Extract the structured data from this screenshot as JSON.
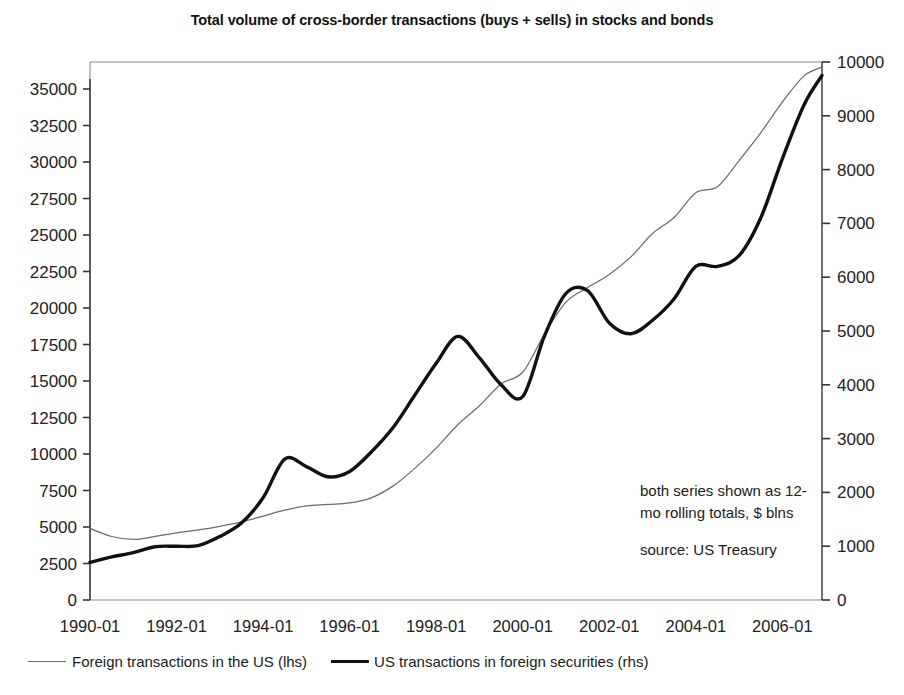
{
  "chart_data": {
    "type": "line",
    "title": "Total volume of cross-border transactions (buys + sells) in stocks and bonds",
    "xlabel": "",
    "ylabel": "",
    "grid": false,
    "legend_position": "bottom-left",
    "annotations": [
      "both series shown as 12-mo rolling totals, $ blns",
      "source: US Treasury"
    ],
    "x_tick_labels": [
      "1990-01",
      "1992-01",
      "1994-01",
      "1996-01",
      "1998-01",
      "2000-01",
      "2002-01",
      "2004-01",
      "2006-01"
    ],
    "x_range": [
      "1990-01",
      "2006-12"
    ],
    "axes": {
      "left": {
        "label": "Foreign transactions in the US (lhs)",
        "ylim": [
          0,
          35000
        ],
        "ticks": [
          0,
          2500,
          5000,
          7500,
          10000,
          12500,
          15000,
          17500,
          20000,
          22500,
          25000,
          27500,
          30000,
          32500,
          35000
        ],
        "tick_labels": [
          "0",
          "2500",
          "5000",
          "7500",
          "10000",
          "12500",
          "15000",
          "17500",
          "20000",
          "22500",
          "25000",
          "27500",
          "30000",
          "32500",
          "35000"
        ]
      },
      "right": {
        "label": "US transactions in foreign securities (rhs)",
        "ylim": [
          0,
          10000
        ],
        "ticks": [
          0,
          1000,
          2000,
          3000,
          4000,
          5000,
          6000,
          7000,
          8000,
          9000,
          10000
        ],
        "tick_labels": [
          "0",
          "1000",
          "2000",
          "3000",
          "4000",
          "5000",
          "6000",
          "7000",
          "8000",
          "9000",
          "10000"
        ]
      }
    },
    "series": [
      {
        "name": "Foreign transactions in the US (lhs)",
        "axis": "left",
        "style": "thin",
        "color": "#6b6b6b",
        "x": [
          "1990-01",
          "1990-07",
          "1991-01",
          "1991-07",
          "1992-01",
          "1992-07",
          "1993-01",
          "1993-07",
          "1994-01",
          "1994-07",
          "1995-01",
          "1995-07",
          "1996-01",
          "1996-07",
          "1997-01",
          "1997-07",
          "1998-01",
          "1998-07",
          "1999-01",
          "1999-07",
          "2000-01",
          "2000-07",
          "2001-01",
          "2001-07",
          "2002-01",
          "2002-07",
          "2003-01",
          "2003-07",
          "2004-01",
          "2004-07",
          "2005-01",
          "2005-07",
          "2006-01",
          "2006-07",
          "2006-12"
        ],
        "values": [
          4900,
          4350,
          4150,
          4350,
          4600,
          4800,
          5050,
          5350,
          5750,
          6150,
          6450,
          6550,
          6650,
          7000,
          7800,
          9000,
          10400,
          12000,
          13300,
          14800,
          15600,
          18200,
          20400,
          21400,
          22300,
          23500,
          25100,
          26200,
          27900,
          28300,
          30100,
          32000,
          34100,
          35900,
          36500
        ]
      },
      {
        "name": "US transactions in foreign securities (rhs)",
        "axis": "right",
        "style": "thick",
        "color": "#111111",
        "x": [
          "1990-01",
          "1990-07",
          "1991-01",
          "1991-07",
          "1992-01",
          "1992-07",
          "1993-01",
          "1993-07",
          "1994-01",
          "1994-07",
          "1995-01",
          "1995-07",
          "1996-01",
          "1996-07",
          "1997-01",
          "1997-07",
          "1998-01",
          "1998-07",
          "1999-01",
          "1999-07",
          "2000-01",
          "2000-07",
          "2001-01",
          "2001-07",
          "2002-01",
          "2002-07",
          "2003-01",
          "2003-07",
          "2004-01",
          "2004-07",
          "2005-01",
          "2005-07",
          "2006-01",
          "2006-07",
          "2006-12"
        ],
        "values": [
          700,
          800,
          880,
          990,
          1000,
          1010,
          1180,
          1430,
          1900,
          2620,
          2480,
          2290,
          2390,
          2750,
          3200,
          3800,
          4400,
          4900,
          4500,
          4000,
          3780,
          4900,
          5700,
          5750,
          5150,
          4950,
          5200,
          5600,
          6200,
          6200,
          6400,
          7100,
          8200,
          9200,
          9750
        ]
      }
    ]
  },
  "title": {
    "text": "Total volume of cross-border transactions (buys + sells) in stocks and bonds"
  },
  "legend": {
    "entries": [
      {
        "label": "Foreign transactions in the US (lhs)",
        "style": "thin"
      },
      {
        "label": "US transactions in foreign securities (rhs)",
        "style": "thick"
      }
    ]
  },
  "annotation": {
    "line1": "both series shown as 12-",
    "line2": "mo rolling totals, $ blns",
    "line3": "source: US Treasury"
  }
}
